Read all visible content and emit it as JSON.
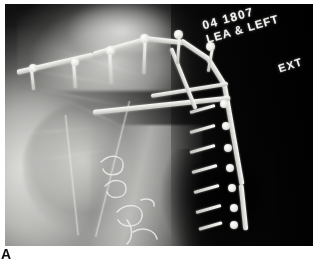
{
  "figure": {
    "panel_label": "A"
  },
  "radiograph": {
    "modality_label": "x-ray-radiograph",
    "anatomy": "left shoulder / proximal humerus",
    "projection_note": "EXT",
    "markers": {
      "accession_id": "04 1807",
      "side_marker": "LEA & LEFT",
      "rotation_marker": "EXT"
    },
    "hardware": {
      "implant_label": "proximal humerus locking plate",
      "plate_segment_count": 5,
      "screw_count": 13,
      "cerclage_wire_count": 4
    },
    "colors": {
      "metal": "#f2f2ef",
      "bone": "#d7d7d4",
      "soft_tissue": "#9a9a98",
      "background_air": "#050505",
      "margin": "#ffffff",
      "label_text": "#0d0d0d",
      "marker_text": "#f2f2ef"
    }
  }
}
